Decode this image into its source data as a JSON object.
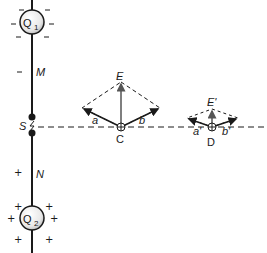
{
  "diagram": {
    "charges": {
      "q1": {
        "label": "Q",
        "subscript": "1",
        "sign": "−"
      },
      "q2": {
        "label": "Q",
        "subscript": "2",
        "sign": "+"
      }
    },
    "rod_labels": {
      "upper": "M",
      "lower": "N",
      "spark_gap": "S"
    },
    "point_c": {
      "label": "C",
      "field": "E",
      "component_a": "a",
      "component_b": "b"
    },
    "point_d": {
      "label": "D",
      "field": "E'",
      "component_a": "a'",
      "component_b": "b'"
    },
    "signs": {
      "negative": "−",
      "positive": "+"
    },
    "colors": {
      "ink": "#1a1a1a",
      "field_arrow": "#555555"
    }
  }
}
